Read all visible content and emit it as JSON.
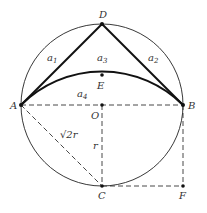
{
  "diagram": {
    "type": "geometry",
    "colors": {
      "stroke": "#222222",
      "background": "#ffffff"
    },
    "circle": {
      "center": "O",
      "radius_label": "r"
    },
    "points": {
      "A": {
        "label": "A",
        "x": 21,
        "y": 105
      },
      "B": {
        "label": "B",
        "x": 183,
        "y": 105
      },
      "O": {
        "label": "O",
        "x": 102,
        "y": 105
      },
      "D": {
        "label": "D",
        "x": 102,
        "y": 24
      },
      "E": {
        "label": "E",
        "x": 102,
        "y": 75
      },
      "C": {
        "label": "C",
        "x": 102,
        "y": 186
      },
      "F": {
        "label": "F",
        "x": 183,
        "y": 186
      }
    },
    "region_labels": {
      "a1": {
        "base": "a",
        "sub": "1"
      },
      "a2": {
        "base": "a",
        "sub": "2"
      },
      "a3": {
        "base": "a",
        "sub": "3"
      },
      "a4": {
        "base": "a",
        "sub": "4"
      }
    },
    "segment_labels": {
      "AC": "√2r",
      "OC": "r"
    },
    "solid_segments": [
      "AD",
      "DB"
    ],
    "arcs": [
      "circle ABCD",
      "arc AEB (radius √2r, center C)"
    ],
    "dashed_segments": [
      "AB",
      "OC",
      "AC",
      "CF",
      "BF"
    ]
  }
}
